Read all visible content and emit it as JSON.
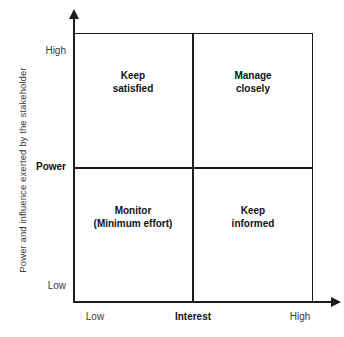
{
  "chart_data": {
    "type": "table",
    "title": "",
    "xlabel": "Interest",
    "ylabel": "Power",
    "axis_title_y": "Power and influence exerted by the stakeholder",
    "x_ticks": [
      "Low",
      "High"
    ],
    "y_ticks": [
      "Low",
      "High"
    ],
    "grid": true,
    "legend": "none",
    "quadrants": [
      {
        "id": "top-left",
        "x": "Low",
        "y": "High",
        "line1": "Keep",
        "line2": "satisfied"
      },
      {
        "id": "top-right",
        "x": "High",
        "y": "High",
        "line1": "Manage",
        "line2": "closely"
      },
      {
        "id": "bottom-left",
        "x": "Low",
        "y": "Low",
        "line1": "Monitor",
        "line2": "(Minimum effort)"
      },
      {
        "id": "bottom-right",
        "x": "High",
        "y": "Low",
        "line1": "Keep",
        "line2": "informed"
      }
    ],
    "colors": {
      "line": "#1c1c1c",
      "background": "#ffffff",
      "label_text": "#3a3a3a",
      "emphasis_text": "#111111"
    }
  },
  "axes": {
    "y_title": "Power and influence exerted by the stakeholder",
    "y_high": "High",
    "y_mid": "Power",
    "y_low": "Low",
    "x_low": "Low",
    "x_mid": "Interest",
    "x_high": "High"
  },
  "quadrants": {
    "top_left": {
      "line1": "Keep",
      "line2": "satisfied"
    },
    "top_right": {
      "line1": "Manage",
      "line2": "closely"
    },
    "bottom_left": {
      "line1": "Monitor",
      "line2": "(Minimum effort)"
    },
    "bottom_right": {
      "line1": "Keep",
      "line2": "informed"
    }
  }
}
